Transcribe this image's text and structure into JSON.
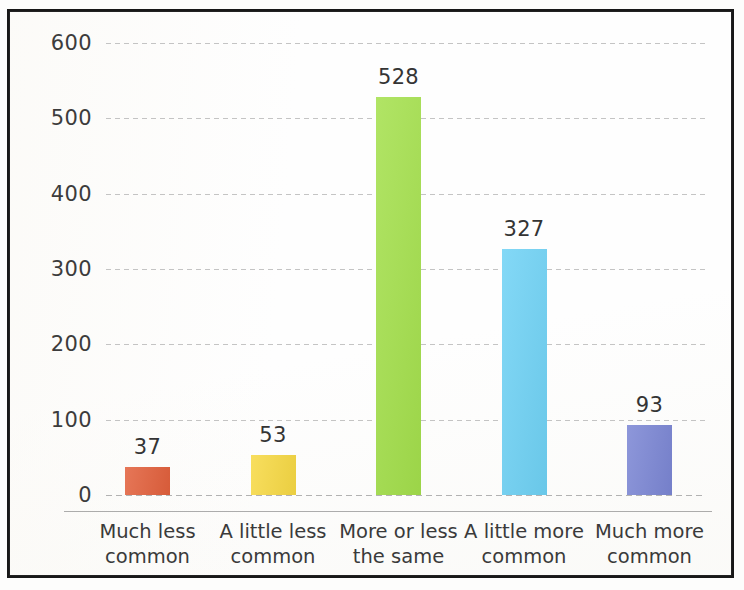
{
  "chart_data": {
    "type": "bar",
    "title": "",
    "subtitle": "",
    "xlabel": "",
    "ylabel": "",
    "ylim": [
      0,
      600
    ],
    "yticks": [
      0,
      100,
      200,
      300,
      400,
      500,
      600
    ],
    "ytick_labels": [
      "0",
      "100",
      "200",
      "300",
      "400",
      "500",
      "600"
    ],
    "grid": true,
    "legend": false,
    "legend_position": "none",
    "categories": [
      "Much less common",
      "A little less common",
      "More or less the same",
      "A little more common",
      "Much more common"
    ],
    "category_lines": [
      [
        "Much less",
        "common"
      ],
      [
        "A little less",
        "common"
      ],
      [
        "More or less",
        "the same"
      ],
      [
        "A little more",
        "common"
      ],
      [
        "Much more",
        "common"
      ]
    ],
    "values": [
      37,
      53,
      528,
      327,
      93
    ],
    "value_labels": [
      "37",
      "53",
      "528",
      "327",
      "93"
    ],
    "colors": [
      "#E2603C",
      "#F7D944",
      "#A4E04C",
      "#6FD2F5",
      "#7B86D4"
    ],
    "bars": [
      {
        "category": "Much less common",
        "value": 37,
        "label": "37",
        "color": "#E2603C"
      },
      {
        "category": "A little less common",
        "value": 53,
        "label": "53",
        "color": "#F7D944"
      },
      {
        "category": "More or less the same",
        "value": 528,
        "label": "528",
        "color": "#A4E04C"
      },
      {
        "category": "A little more common",
        "value": 327,
        "label": "327",
        "color": "#6FD2F5"
      },
      {
        "category": "Much more common",
        "value": 93,
        "label": "93",
        "color": "#7B86D4"
      }
    ]
  },
  "frame": {
    "border_color": "#181818",
    "background_color": "#FEFEFE",
    "gridline_color": "#BABABA",
    "axis_rule_color": "#9D9D9D",
    "text_color": "#3A3A3A"
  }
}
